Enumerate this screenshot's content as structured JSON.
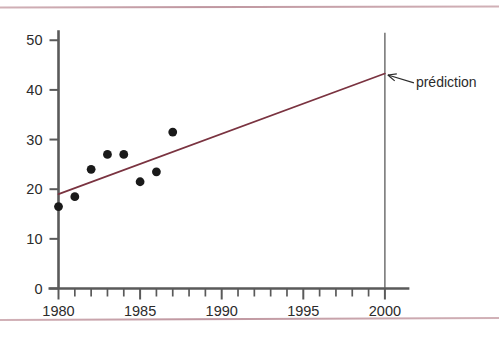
{
  "figure": {
    "background_color": "#ffffff",
    "rule_color": "#b4848f",
    "axis_color": "#5a5a5a",
    "point_color": "#1a1a1a",
    "trend_color": "#7a3340",
    "vline_color": "#5a5a5a",
    "annotation_color": "#2b2b2b"
  },
  "chart_data": {
    "type": "scatter",
    "title": "",
    "xlabel": "",
    "ylabel": "",
    "xlim": [
      1979.2,
      2001.5
    ],
    "ylim": [
      0,
      52
    ],
    "grid": false,
    "legend": null,
    "x_ticks_major": [
      1980,
      1985,
      1990,
      1995,
      2000
    ],
    "x_tick_labels": [
      "1980",
      "1985",
      "1990",
      "1995",
      "2000"
    ],
    "x_ticks_minor": [
      1981,
      1982,
      1983,
      1984,
      1986,
      1987,
      1988,
      1989,
      1991,
      1992,
      1993,
      1994,
      1996,
      1997,
      1998,
      1999
    ],
    "y_ticks_major": [
      0,
      10,
      20,
      30,
      40,
      50
    ],
    "y_tick_labels": [
      "0",
      "10",
      "20",
      "30",
      "40",
      "50"
    ],
    "series": [
      {
        "name": "observations",
        "type": "scatter",
        "x": [
          1980,
          1981,
          1982,
          1983,
          1984,
          1985,
          1986,
          1987
        ],
        "y": [
          16.5,
          18.5,
          24.0,
          27.0,
          27.0,
          21.5,
          23.5,
          31.5
        ]
      },
      {
        "name": "droite de régression",
        "type": "line",
        "x": [
          1980,
          2000
        ],
        "y": [
          19.0,
          43.3
        ]
      }
    ],
    "reference_lines": [
      {
        "name": "annee-prediction",
        "orientation": "vertical",
        "x": 2000,
        "y_from": 0,
        "y_to": 51.5
      }
    ],
    "annotations": [
      {
        "name": "prediction",
        "text": "prédiction",
        "target_x": 2000,
        "target_y": 43.3,
        "text_x": 2001.9,
        "text_y": 40.6,
        "arrow": true
      }
    ]
  }
}
